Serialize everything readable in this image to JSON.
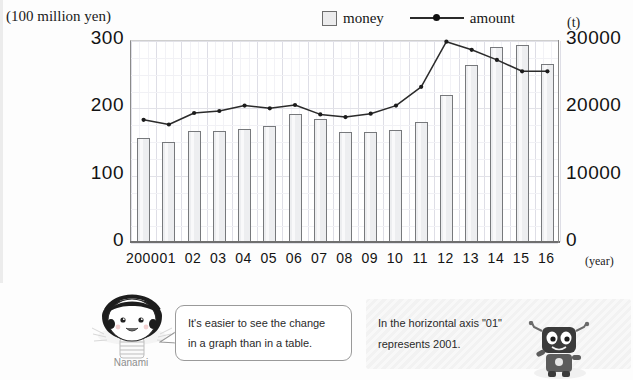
{
  "axes": {
    "left_unit": "(100 million yen)",
    "right_unit": "(t)",
    "x_unit": "(year)",
    "y_left_ticks": [
      "300",
      "200",
      "100",
      "0"
    ],
    "y_right_ticks": [
      "30000",
      "20000",
      "10000",
      "0"
    ]
  },
  "legend": {
    "money_label": "money",
    "amount_label": "amount"
  },
  "chart_data": {
    "type": "bar",
    "title": "",
    "subtitle": "",
    "xlabel": "(year)",
    "ylabel": "(100 million yen)",
    "y2label": "(t)",
    "ylim": [
      0,
      300
    ],
    "y2lim": [
      0,
      30000
    ],
    "grid": true,
    "legend_position": "top",
    "categories": [
      "2000",
      "01",
      "02",
      "03",
      "04",
      "05",
      "06",
      "07",
      "08",
      "09",
      "10",
      "11",
      "12",
      "13",
      "14",
      "15",
      "16"
    ],
    "series": [
      {
        "name": "money",
        "type": "bar",
        "axis": "left",
        "unit": "100 million yen",
        "values": [
          155,
          148,
          165,
          165,
          168,
          173,
          190,
          182,
          163,
          163,
          167,
          178,
          218,
          263,
          290,
          292,
          265
        ]
      },
      {
        "name": "amount",
        "type": "line",
        "axis": "right",
        "unit": "t",
        "values": [
          18300,
          17600,
          19300,
          19600,
          20400,
          20000,
          20500,
          19100,
          18700,
          19200,
          20400,
          23200,
          29900,
          28700,
          27200,
          25500,
          25500
        ]
      }
    ]
  },
  "bottom": {
    "nanami_name": "Nanami",
    "bubble_line1": "It's easier to see the change",
    "bubble_line2": "in a graph than in a table.",
    "note_line1": "In the horizontal axis \"01\"",
    "note_line2": "represents 2001."
  },
  "colors": {
    "bar_fill": "#edeef0",
    "bar_border": "#77797c",
    "line": "#2b2b2b",
    "grid": "#e9e9ee",
    "axis": "#8a8a8a",
    "text": "#131313"
  }
}
